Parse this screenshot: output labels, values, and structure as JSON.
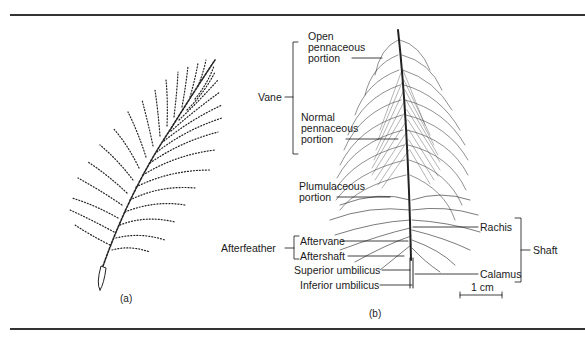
{
  "figure": {
    "panels": [
      {
        "id": "a",
        "caption": "(a)"
      },
      {
        "id": "b",
        "caption": "(b)"
      }
    ],
    "labels": {
      "open_pennaceous": [
        "Open",
        "pennaceous",
        "portion"
      ],
      "normal_pennaceous": [
        "Normal",
        "pennaceous",
        "portion"
      ],
      "vane": "Vane",
      "plumulaceous": [
        "Plumulaceous",
        "portion"
      ],
      "afterfeather": "Afterfeather",
      "aftervane": "Aftervane",
      "aftershaft": "Aftershaft",
      "superior_umbilicus": "Superior umbilicus",
      "inferior_umbilicus": "Inferior umbilicus",
      "rachis": "Rachis",
      "shaft": "Shaft",
      "calamus": "Calamus",
      "scale_bar": "1 cm"
    },
    "colors": {
      "ink": "#1a1a1a",
      "rule": "#333333",
      "background": "#ffffff"
    }
  }
}
